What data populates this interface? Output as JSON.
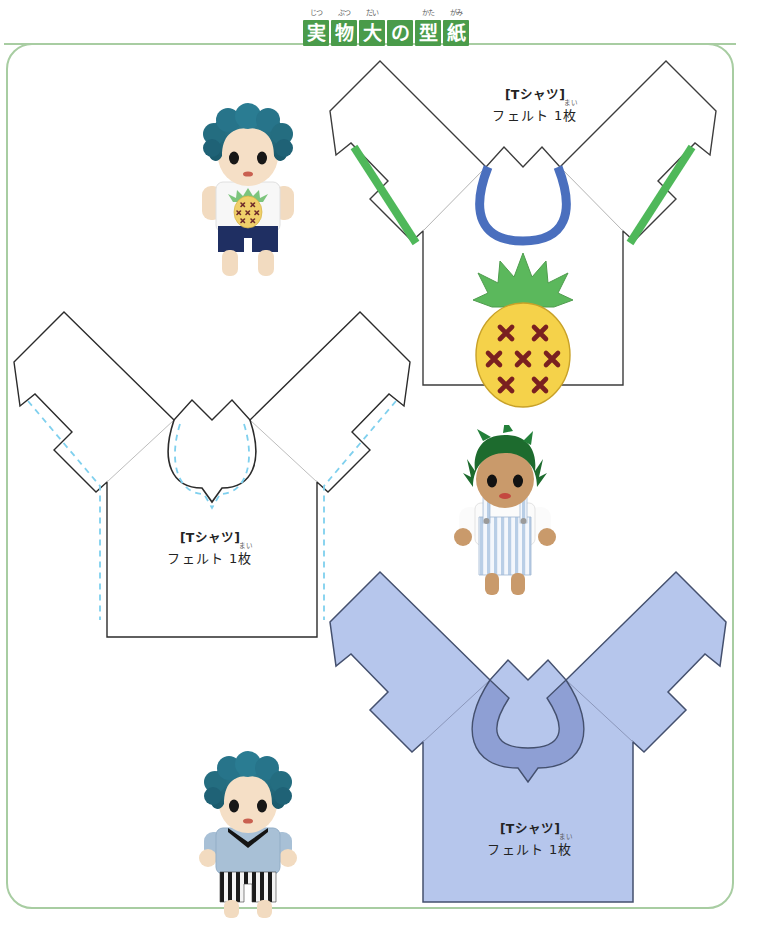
{
  "page": {
    "frame_color": "#a8cda2",
    "background": "#ffffff"
  },
  "header": {
    "banner_color": "#4a9b4a",
    "banner_text_color": "#ffffff",
    "characters": [
      {
        "char": "実",
        "furigana": "じつ"
      },
      {
        "char": "物",
        "furigana": "ぶつ"
      },
      {
        "char": "大",
        "furigana": "だい"
      },
      {
        "char": "の",
        "furigana": ""
      },
      {
        "char": "型",
        "furigana": "かた"
      },
      {
        "char": "紙",
        "furigana": "がみ"
      }
    ]
  },
  "patterns": [
    {
      "id": "tshirt-pineapple",
      "label_title": "[Tシャツ]",
      "label_sub": "フェルト 1枚",
      "label_sub_furigana": "まい",
      "fill": "#ffffff",
      "outline": "#3c3c3c",
      "neck_trim_color": "#4a6fbe",
      "sleeve_trim_color": "#4fb85a",
      "applique": {
        "name": "pineapple",
        "body_color": "#f5d24a",
        "leaf_color": "#5bb85c",
        "mark_color": "#7a2020",
        "mark_count": 7
      }
    },
    {
      "id": "tshirt-white-dashed",
      "label_title": "[Tシャツ]",
      "label_sub": "フェルト 1枚",
      "label_sub_furigana": "まい",
      "fill": "#ffffff",
      "outline": "#2b2b2b",
      "stitch_line_color": "#7fd0ee",
      "stitch_line_style": "dashed"
    },
    {
      "id": "tshirt-blue",
      "label_title": "[Tシャツ]",
      "label_sub": "フェルト 1枚",
      "label_sub_furigana": "まい",
      "fill": "#b6c6ec",
      "outline": "#44506e",
      "collar_color": "#8e9fd4"
    }
  ],
  "dolls": [
    {
      "id": "doll-pineapple-tee",
      "hair_color": "#236b7d",
      "skin_color": "#f3dcc2",
      "shirt_color": "#f6f6f6",
      "pants_color": "#1f2f62",
      "motif": "pineapple"
    },
    {
      "id": "doll-striped-overalls",
      "hair_color": "#1d6b2e",
      "skin_color": "#c99a6b",
      "shirt_color": "#fbfbfb",
      "pants_color": "#cfdcee",
      "motif": "stripes"
    },
    {
      "id": "doll-blue-shirt",
      "hair_color": "#236b7d",
      "skin_color": "#f3dcc2",
      "shirt_color": "#a8c0d6",
      "collar_color": "#1a1a1a",
      "pants_color": "#1d1d1d",
      "motif": "striped-pants"
    }
  ]
}
